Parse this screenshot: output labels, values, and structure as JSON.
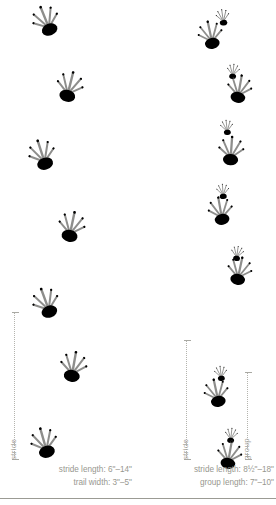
{
  "figure": {
    "ink_color": "#8e8e8c",
    "line_color": "#b4b4ae",
    "text_color": "#97978f"
  },
  "panels": [
    {
      "id": "left",
      "name": "left-track-pattern",
      "measures": [
        {
          "id": "left-stride",
          "label": "stride",
          "top": 312,
          "height": 148,
          "x": 14
        }
      ],
      "captions": [
        "stride length: 6\"–14\"",
        "trail width: 3\"–5\""
      ],
      "tracks": [
        {
          "type": "hind",
          "x": 30,
          "y": 6,
          "rot": -22,
          "scale": 1.0
        },
        {
          "type": "hind",
          "x": 52,
          "y": 72,
          "rot": 14,
          "scale": 1.0
        },
        {
          "type": "hind",
          "x": 26,
          "y": 140,
          "rot": -18,
          "scale": 1.0
        },
        {
          "type": "hind",
          "x": 54,
          "y": 212,
          "rot": 12,
          "scale": 1.0
        },
        {
          "type": "hind",
          "x": 30,
          "y": 288,
          "rot": -20,
          "scale": 1.0
        },
        {
          "type": "hind",
          "x": 56,
          "y": 352,
          "rot": 10,
          "scale": 1.0
        },
        {
          "type": "hind",
          "x": 28,
          "y": 428,
          "rot": -16,
          "scale": 1.0
        }
      ]
    },
    {
      "id": "right",
      "name": "right-track-pattern",
      "measures": [
        {
          "id": "right-stride",
          "label": "stride",
          "top": 340,
          "height": 120,
          "x": 186
        },
        {
          "id": "right-group",
          "label": "group",
          "top": 372,
          "height": 88,
          "x": 247
        }
      ],
      "captions": [
        "stride length: 8½\"–18\"",
        "group length: 7\"–10\""
      ],
      "tracks": [
        {
          "type": "front",
          "x": 206,
          "y": 2,
          "rot": -8,
          "scale": 0.62
        },
        {
          "type": "hind",
          "x": 194,
          "y": 20,
          "rot": -12,
          "scale": 0.92
        },
        {
          "type": "front",
          "x": 216,
          "y": 56,
          "rot": 6,
          "scale": 0.58
        },
        {
          "type": "hind",
          "x": 222,
          "y": 74,
          "rot": 10,
          "scale": 0.92
        },
        {
          "type": "front",
          "x": 210,
          "y": 112,
          "rot": -6,
          "scale": 0.58
        },
        {
          "type": "hind",
          "x": 214,
          "y": 136,
          "rot": 4,
          "scale": 0.95
        },
        {
          "type": "front",
          "x": 206,
          "y": 176,
          "rot": -4,
          "scale": 0.58
        },
        {
          "type": "hind",
          "x": 204,
          "y": 196,
          "rot": -10,
          "scale": 0.92
        },
        {
          "type": "front",
          "x": 220,
          "y": 238,
          "rot": 8,
          "scale": 0.58
        },
        {
          "type": "hind",
          "x": 222,
          "y": 256,
          "rot": 12,
          "scale": 0.92
        },
        {
          "type": "front",
          "x": 204,
          "y": 358,
          "rot": -6,
          "scale": 0.58
        },
        {
          "type": "hind",
          "x": 200,
          "y": 378,
          "rot": -12,
          "scale": 0.92
        },
        {
          "type": "front",
          "x": 214,
          "y": 420,
          "rot": 6,
          "scale": 0.58
        },
        {
          "type": "hind",
          "x": 212,
          "y": 440,
          "rot": 10,
          "scale": 0.92
        }
      ]
    }
  ]
}
